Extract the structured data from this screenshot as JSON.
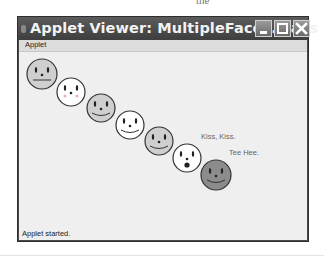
{
  "page_fragment": "the",
  "window": {
    "title": "Applet Viewer: MultipleFaces.class",
    "buttons": {
      "minimize": "minimize",
      "maximize": "maximize",
      "close": "close"
    }
  },
  "menubar": {
    "items": [
      {
        "label": "Applet"
      }
    ]
  },
  "applet": {
    "faces": [
      {
        "cx": 23,
        "cy": 22,
        "r": 15,
        "fill": "#cfcfcf",
        "mouth": "flat",
        "cheeks": false
      },
      {
        "cx": 52,
        "cy": 40,
        "r": 14,
        "fill": "#ffffff",
        "mouth": "none",
        "cheeks": true
      },
      {
        "cx": 82,
        "cy": 56,
        "r": 14,
        "fill": "#cfcfcf",
        "mouth": "smile",
        "cheeks": false
      },
      {
        "cx": 111,
        "cy": 73,
        "r": 14,
        "fill": "#ffffff",
        "mouth": "smile",
        "cheeks": false
      },
      {
        "cx": 140,
        "cy": 89,
        "r": 14,
        "fill": "#cfcfcf",
        "mouth": "smile",
        "cheeks": false
      },
      {
        "cx": 168,
        "cy": 106,
        "r": 14,
        "fill": "#ffffff",
        "mouth": "o",
        "cheeks": false
      },
      {
        "cx": 197,
        "cy": 123,
        "r": 15,
        "fill": "#8c8c8c",
        "mouth": "smile",
        "cheeks": false
      }
    ],
    "labels": [
      {
        "text": "Kiss, Kiss.",
        "x": 182,
        "y": 85
      },
      {
        "text": "Tee Hee.",
        "x": 210,
        "y": 101
      }
    ]
  },
  "status": {
    "text": "Applet started."
  },
  "colors": {
    "titlebar": "#444444",
    "content_bg": "#efefef",
    "face_stroke": "#333333"
  }
}
